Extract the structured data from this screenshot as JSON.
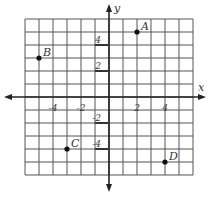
{
  "chart_data": {
    "type": "scatter",
    "title": "",
    "xlabel": "x",
    "ylabel": "y",
    "xlim": [
      -6,
      6
    ],
    "ylim": [
      -6,
      6
    ],
    "grid": true,
    "x_tick_labels": [
      "-4",
      "-2",
      "2",
      "4"
    ],
    "y_tick_labels": [
      "4",
      "2",
      "-2",
      "-4"
    ],
    "points": [
      {
        "label": "A",
        "x": 2,
        "y": 5
      },
      {
        "label": "B",
        "x": -5,
        "y": 3
      },
      {
        "label": "C",
        "x": -3,
        "y": -4
      },
      {
        "label": "D",
        "x": 4,
        "y": -5
      }
    ]
  }
}
